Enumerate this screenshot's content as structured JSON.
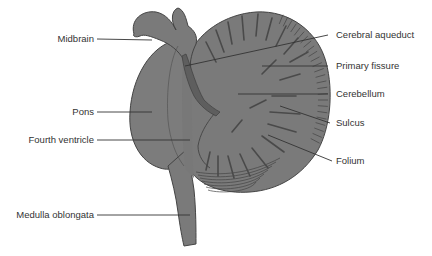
{
  "diagram": {
    "colors": {
      "tissue": "#7a7a7a",
      "tissue_light": "#848484",
      "outline": "#444444",
      "ventricle": "#5e5e5e",
      "leader_line": "#333333",
      "label_text": "#333333",
      "background": "#ffffff"
    },
    "labels_left": [
      {
        "id": "midbrain",
        "text": "Midbrain"
      },
      {
        "id": "pons",
        "text": "Pons"
      },
      {
        "id": "fourth-ventricle",
        "text": "Fourth ventricle"
      },
      {
        "id": "medulla-oblongata",
        "text": "Medulla oblongata"
      }
    ],
    "labels_right": [
      {
        "id": "cerebral-aqueduct",
        "text": "Cerebral aqueduct"
      },
      {
        "id": "primary-fissure",
        "text": "Primary fissure"
      },
      {
        "id": "cerebellum",
        "text": "Cerebellum"
      },
      {
        "id": "sulcus",
        "text": "Sulcus"
      },
      {
        "id": "folium",
        "text": "Folium"
      }
    ]
  }
}
